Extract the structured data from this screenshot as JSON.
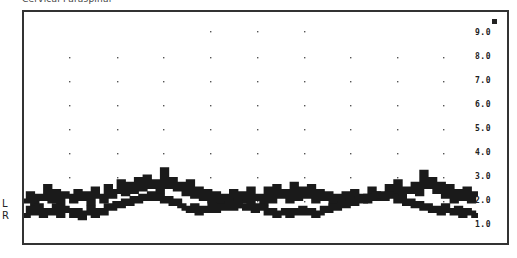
{
  "title": "Cervical Paraspinal",
  "side_labels": {
    "left": "L",
    "right": "R"
  },
  "chart_data": {
    "type": "line",
    "title": "Cervical Paraspinal",
    "xlabel": "",
    "ylabel": "",
    "ylim": [
      1.0,
      9.0
    ],
    "yticks": [
      "9.0",
      "8.0",
      "7.0",
      "6.0",
      "5.0",
      "4.0",
      "3.0",
      "2.0",
      "1.0"
    ],
    "grid": "dotted",
    "legend": [
      "L",
      "R"
    ],
    "series": [
      {
        "name": "L",
        "values": [
          2.0,
          2.3,
          1.9,
          2.2,
          2.1,
          2.6,
          2.0,
          2.4,
          1.9,
          2.3,
          2.2,
          2.0,
          2.4,
          2.1,
          2.3,
          1.9,
          2.5,
          2.2,
          2.0,
          2.6,
          2.2,
          2.4,
          2.8,
          2.3,
          2.7,
          2.4,
          2.9,
          2.5,
          3.0,
          2.6,
          2.8,
          2.4,
          3.3,
          2.6,
          2.9,
          2.5,
          2.7,
          2.3,
          2.8,
          2.2,
          2.5,
          2.1,
          2.4,
          2.0,
          2.3,
          1.9,
          2.2,
          2.1,
          2.4,
          1.8,
          2.3,
          2.0,
          2.5,
          2.1,
          2.2,
          1.9,
          2.5,
          2.0,
          2.6,
          2.2,
          2.4,
          2.0,
          2.7,
          2.1,
          2.5,
          2.2,
          2.6,
          2.0,
          2.4,
          2.1,
          2.3,
          1.9,
          2.2,
          2.0,
          2.3,
          1.9,
          2.4,
          2.1,
          2.2,
          2.0,
          2.5,
          2.1,
          2.3,
          2.2,
          2.6,
          2.3,
          2.8,
          2.2,
          2.5,
          2.4,
          2.7,
          2.3,
          3.2,
          2.6,
          2.9,
          2.4,
          2.7,
          2.2,
          2.6,
          2.0,
          2.4,
          2.1,
          2.5,
          2.0,
          2.3
        ],
        "approx_range": [
          1.8,
          3.3
        ]
      },
      {
        "name": "R",
        "values": [
          1.4,
          1.7,
          1.5,
          1.8,
          1.4,
          1.6,
          1.5,
          1.8,
          1.4,
          1.7,
          1.6,
          1.4,
          1.6,
          1.3,
          1.5,
          1.7,
          1.4,
          1.6,
          1.5,
          1.8,
          1.7,
          1.9,
          1.8,
          2.0,
          1.9,
          2.1,
          2.0,
          2.2,
          2.1,
          2.3,
          2.1,
          2.2,
          2.0,
          2.1,
          1.9,
          2.0,
          1.8,
          1.7,
          1.6,
          1.8,
          1.5,
          1.7,
          1.6,
          1.9,
          1.6,
          1.8,
          1.7,
          1.9,
          1.7,
          2.0,
          1.8,
          1.7,
          1.9,
          1.6,
          1.8,
          1.7,
          1.5,
          1.6,
          1.4,
          1.5,
          1.6,
          1.4,
          1.6,
          1.5,
          1.7,
          1.5,
          1.6,
          1.4,
          1.5,
          1.7,
          1.6,
          1.8,
          1.7,
          1.9,
          1.8,
          2.0,
          1.9,
          2.1,
          2.0,
          2.2,
          2.1,
          2.3,
          2.2,
          2.1,
          2.3,
          2.2,
          2.0,
          2.1,
          1.9,
          2.0,
          1.8,
          1.9,
          1.7,
          1.8,
          1.6,
          1.7,
          1.5,
          1.8,
          1.6,
          1.5,
          1.7,
          1.4,
          1.6,
          1.5,
          1.4
        ],
        "approx_range": [
          1.3,
          2.3
        ]
      }
    ]
  },
  "colors": {
    "trace": "#1a1a1a",
    "frame": "#333333",
    "grid_dot": "#555555",
    "background": "#ffffff"
  }
}
